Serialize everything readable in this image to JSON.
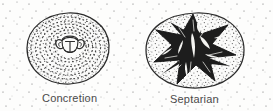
{
  "figure": {
    "kind": "geological-line-drawing",
    "background_color": "#fdfdfc",
    "ink_color": "#2b2b2b",
    "label_color": "#3b3b3b",
    "panels": [
      {
        "id": "concretion",
        "label": "Concretion",
        "description": "oval nodule with concentric stippled rings around a fossil nucleus",
        "outline": {
          "cx": 68,
          "cy": 48,
          "rx": 41,
          "ry": 35
        },
        "nucleus": {
          "cx": 70,
          "cy": 45,
          "rx": 13,
          "ry": 10
        },
        "ring_count": 7
      },
      {
        "id": "septarian",
        "label": "Septarian",
        "description": "oval nodule with dark radiating star-shaped septarian cracks filled with pale calcite veins",
        "outline": {
          "cx": 195,
          "cy": 50,
          "rx": 49,
          "ry": 37
        },
        "star": {
          "cx": 193,
          "cy": 48,
          "points": 7,
          "outer_r": 40,
          "inner_r": 15
        },
        "crack_fill": "#1d1d1d",
        "vein_fill": "#f4f4f1"
      }
    ],
    "matrix": {
      "name": "sediment-matrix-stipple",
      "dot_color": "#6f6f6f",
      "density": "sparse"
    }
  }
}
